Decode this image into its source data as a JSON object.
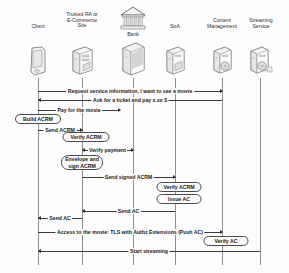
{
  "diagram": {
    "type": "uml-sequence-diagram",
    "title": "",
    "background_color": "#fdfdfd",
    "line_color": "#3a3a3a",
    "actors": [
      {
        "id": "client",
        "label": "Client",
        "icon": "mobile-device-icon",
        "x": 38,
        "label_lines": [
          "Client"
        ]
      },
      {
        "id": "ra",
        "label": "Trusted RA or E-Commerce Site",
        "icon": "server-tower-icon",
        "x": 82,
        "label_lines": [
          "Trusted RA or",
          "E-Commerce",
          "Site"
        ]
      },
      {
        "id": "bank",
        "label": "Bank",
        "icon": "bank-building-icon",
        "x": 133,
        "label_lines": [
          "Bank"
        ]
      },
      {
        "id": "soa",
        "label": "SoA",
        "icon": "server-icon",
        "x": 175,
        "label_lines": [
          "SoA"
        ]
      },
      {
        "id": "content",
        "label": "Content Management",
        "icon": "media-server-icon",
        "x": 222,
        "label_lines": [
          "Content",
          "Management"
        ]
      },
      {
        "id": "streaming",
        "label": "Streaming Service",
        "icon": "media-server-icon",
        "x": 260,
        "label_lines": [
          "Streaming",
          "Service"
        ]
      }
    ],
    "messages": [
      {
        "id": "m1",
        "label": "Request service information, I want to see a movie",
        "from": "client",
        "to": "content",
        "direction": "right",
        "y": 91
      },
      {
        "id": "m2",
        "label": "Ask for a ticket and pay x.xx $",
        "from": "content",
        "to": "client",
        "direction": "left",
        "y": 100
      },
      {
        "id": "m3",
        "label": "Pay for the movie",
        "from": "client",
        "to": "ra",
        "direction": "right",
        "y": 110
      },
      {
        "id": "m4",
        "label": "Send ACRM",
        "from": "client",
        "to": "ra",
        "direction": "right",
        "y": 130
      },
      {
        "id": "m5",
        "label": "Verify payment",
        "from": "ra",
        "to": "bank",
        "direction": "right",
        "y": 150
      },
      {
        "id": "m6",
        "label": "Send signed ACRM",
        "from": "ra",
        "to": "soa",
        "direction": "right",
        "y": 177
      },
      {
        "id": "m7",
        "label": "Send AC",
        "from": "soa",
        "to": "ra",
        "direction": "left",
        "y": 211
      },
      {
        "id": "m8",
        "label": "Send AC",
        "from": "ra",
        "to": "client",
        "direction": "left",
        "y": 218
      },
      {
        "id": "m9",
        "label": "Access to the movie: TLS with Authz Extensions (Push AC)",
        "from": "client",
        "to": "content",
        "direction": "right",
        "y": 232
      },
      {
        "id": "m10",
        "label": "Start streaming",
        "from": "streaming",
        "to": "client",
        "direction": "left",
        "y": 251
      }
    ],
    "actions": [
      {
        "id": "a1",
        "label": "Build ACRM",
        "actor": "client",
        "y": 119,
        "width": 46,
        "height": 10,
        "lines": [
          "Build ACRM"
        ]
      },
      {
        "id": "a2",
        "label": "Verify ACRM",
        "actor": "ra",
        "y": 137,
        "width": 46,
        "height": 10,
        "lines": [
          "Verify ACRM"
        ]
      },
      {
        "id": "a3",
        "label": "Envelope and sign ACRM",
        "actor": "ra",
        "y": 160,
        "width": 42,
        "height": 15,
        "lines": [
          "Envelope and",
          "sign ACRM"
        ]
      },
      {
        "id": "a4",
        "label": "Verify ACRM",
        "actor": "soa",
        "y": 185,
        "width": 44,
        "height": 10,
        "lines": [
          "Verify ACRM"
        ]
      },
      {
        "id": "a5",
        "label": "Issue AC",
        "actor": "soa",
        "y": 197,
        "width": 44,
        "height": 10,
        "lines": [
          "Issue AC"
        ]
      },
      {
        "id": "a6",
        "label": "Verify AC",
        "actor": "content",
        "y": 240,
        "width": 44,
        "height": 10,
        "lines": [
          "Verify AC"
        ]
      }
    ]
  }
}
